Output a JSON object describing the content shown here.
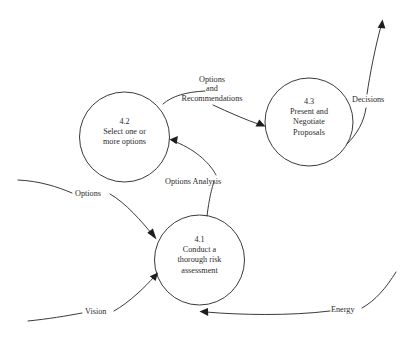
{
  "diagram": {
    "type": "data-flow-diagram",
    "background_color": "#ffffff",
    "stroke_color": "#3a3a3a",
    "text_color": "#2b2b2b",
    "processes": [
      {
        "id": "4.2",
        "name": "select-options",
        "lines": [
          "Select one or",
          "more options"
        ],
        "cx": 124.5,
        "cy": 137,
        "r": 45
      },
      {
        "id": "4.3",
        "name": "present-negotiate",
        "lines": [
          "Present and",
          "Negotiate",
          "Proposals"
        ],
        "cx": 309,
        "cy": 122,
        "r": 44
      },
      {
        "id": "4.1",
        "name": "conduct-risk-assessment",
        "lines": [
          "Conduct a",
          "thorough risk",
          "assessment"
        ],
        "cx": 199.5,
        "cy": 260,
        "r": 45
      }
    ],
    "flows": [
      {
        "name": "options-and-recommendations",
        "lines": [
          "Options",
          "and",
          "Recommendations"
        ],
        "from": "4.2",
        "to": "4.3"
      },
      {
        "name": "decisions",
        "lines": [
          "Decisions"
        ],
        "from": "4.3",
        "to": "external"
      },
      {
        "name": "options-analysis",
        "lines": [
          "Options Analysis"
        ],
        "from": "4.1",
        "to": "4.2"
      },
      {
        "name": "options",
        "lines": [
          "Options"
        ],
        "from": "external",
        "to": "4.1"
      },
      {
        "name": "vision",
        "lines": [
          "Vision"
        ],
        "from": "external",
        "to": "4.1"
      },
      {
        "name": "energy",
        "lines": [
          "Energy"
        ],
        "from": "external",
        "to": "4.1"
      }
    ]
  }
}
